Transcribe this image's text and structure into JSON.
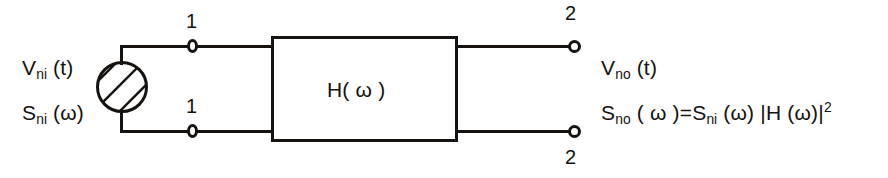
{
  "diagram": {
    "stroke_color": "#15120f",
    "background_color": "#ffffff",
    "block": {
      "label_prefix": "H(",
      "label_symbol": "ω",
      "label_suffix": " )",
      "label_full": "H( ω )"
    },
    "source": {
      "type": "hatched-circle-noise-source",
      "voltage_label_main": "V",
      "voltage_label_sub": "ni",
      "voltage_label_arg": " (t)",
      "psd_label_main": "S",
      "psd_label_sub": "ni",
      "psd_label_arg": " (ω)"
    },
    "output": {
      "voltage_label_main": "V",
      "voltage_label_sub": "no",
      "voltage_label_arg": " (t)",
      "psd_label_main": "S",
      "psd_label_sub": "no",
      "psd_label_mid": "  ( ω )=S",
      "psd_label_sub2": "ni",
      "psd_label_mid2": " (ω) |H (ω)|",
      "psd_label_sup": "2",
      "psd_equation_full": "S_no ( ω )=S_ni (ω) |H (ω)|²"
    },
    "ports": {
      "input_top": "1",
      "input_bottom": "1",
      "output_top": "2",
      "output_bottom": "2"
    }
  }
}
